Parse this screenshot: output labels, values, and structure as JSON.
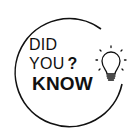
{
  "graphic": {
    "line1": "DID",
    "line2": "YOU",
    "question_mark": "?",
    "line3": "KNOW",
    "icon": "lightbulb-icon",
    "colors": {
      "ink": "#111111",
      "background": "#ffffff"
    }
  }
}
